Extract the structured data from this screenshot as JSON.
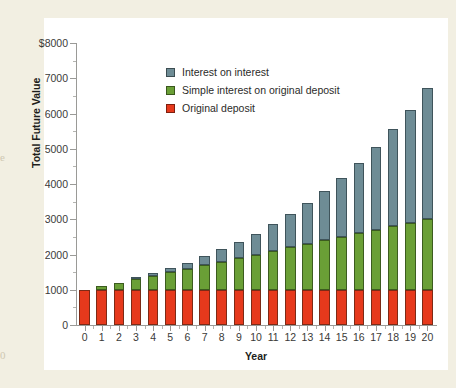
{
  "figure": {
    "background_color": "#f2efe2",
    "panel_color": "#ffffff",
    "edge_glyphs": [
      "e",
      "0"
    ]
  },
  "legend": {
    "position": "inside-top-left",
    "items": [
      {
        "label": "Interest on interest",
        "color": "#6e8c95",
        "key": "compound"
      },
      {
        "label": "Simple interest on original deposit",
        "color": "#6a9f36",
        "key": "simple"
      },
      {
        "label": "Original deposit",
        "color": "#e6391c",
        "key": "deposit"
      }
    ]
  },
  "chart_data": {
    "type": "bar",
    "stacked": true,
    "title": "",
    "xlabel": "Year",
    "ylabel": "Total Future Value",
    "grid": false,
    "xlim": [
      0,
      20
    ],
    "ylim": [
      0,
      8000
    ],
    "ytick_labels": [
      "0",
      "1000",
      "2000",
      "3000",
      "4000",
      "5000",
      "6000",
      "7000",
      "$8000"
    ],
    "yticks": [
      0,
      1000,
      2000,
      3000,
      4000,
      5000,
      6000,
      7000,
      8000
    ],
    "categories": [
      "0",
      "1",
      "2",
      "3",
      "4",
      "5",
      "6",
      "7",
      "8",
      "9",
      "10",
      "11",
      "12",
      "13",
      "14",
      "15",
      "16",
      "17",
      "18",
      "19",
      "20"
    ],
    "series": [
      {
        "name": "Original deposit",
        "color": "#e6391c",
        "values": [
          1000,
          1000,
          1000,
          1000,
          1000,
          1000,
          1000,
          1000,
          1000,
          1000,
          1000,
          1000,
          1000,
          1000,
          1000,
          1000,
          1000,
          1000,
          1000,
          1000,
          1000
        ]
      },
      {
        "name": "Simple interest on original deposit",
        "color": "#6a9f36",
        "values": [
          0,
          100,
          200,
          300,
          400,
          500,
          600,
          700,
          800,
          900,
          1000,
          1100,
          1200,
          1300,
          1400,
          1500,
          1600,
          1700,
          1800,
          1900,
          2000
        ]
      },
      {
        "name": "Interest on interest",
        "color": "#6e8c95",
        "values": [
          0,
          0,
          10,
          31,
          64,
          111,
          172,
          249,
          344,
          458,
          594,
          753,
          938,
          1152,
          1397,
          1677,
          1995,
          2354,
          2759,
          3214,
          3727
        ]
      }
    ],
    "totals": [
      1000,
      1100,
      1210,
      1331,
      1464,
      1611,
      1772,
      1949,
      2144,
      2358,
      2594,
      2853,
      3138,
      3452,
      3797,
      4177,
      4595,
      5054,
      5560,
      6116,
      6727
    ]
  }
}
